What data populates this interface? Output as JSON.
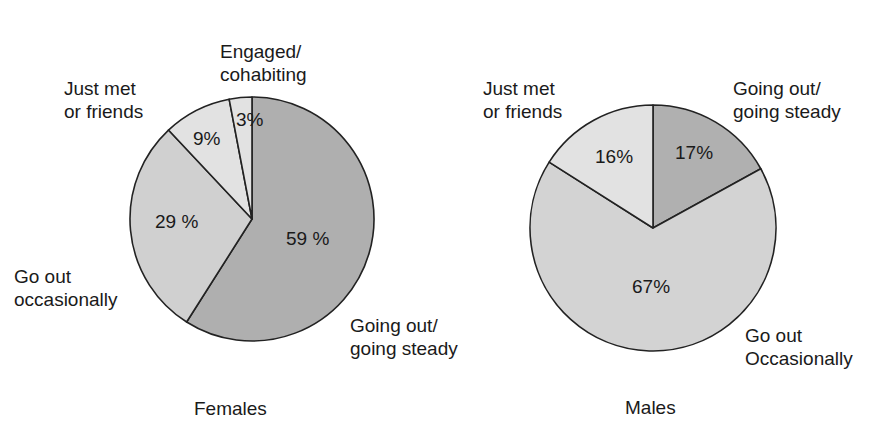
{
  "chart_data": [
    {
      "type": "pie",
      "title": "Females",
      "start": "top, clockwise",
      "categories": [
        "Going out/ going steady",
        "Go out occasionally",
        "Just met or friends",
        "Engaged/ cohabiting"
      ],
      "values": [
        59,
        29,
        9,
        3
      ],
      "value_labels": [
        "59 %",
        "29 %",
        "9%",
        "3%"
      ],
      "colors": [
        "#afafaf",
        "#d0d0d0",
        "#e2e2e2",
        "#e2e2e2"
      ],
      "legend": "none (labels placed beside slices)"
    },
    {
      "type": "pie",
      "title": "Males",
      "start": "top, clockwise",
      "categories": [
        "Going out/ going steady",
        "Go out Occasionally",
        "Just met or friends"
      ],
      "values": [
        17,
        67,
        16
      ],
      "value_labels": [
        "17%",
        "67%",
        "16%"
      ],
      "colors": [
        "#b0b0b0",
        "#d3d3d3",
        "#e2e2e2"
      ],
      "legend": "none (labels placed beside slices)"
    }
  ],
  "females": {
    "title": "Females",
    "labels": {
      "engaged_l1": "Engaged/",
      "engaged_l2": "cohabiting",
      "justmet_l1": "Just met",
      "justmet_l2": "or friends",
      "goout_l1": "Go out",
      "goout_l2": "occasionally",
      "steady_l1": "Going out/",
      "steady_l2": "going steady"
    },
    "pcts": {
      "steady": "59 %",
      "goout": "29 %",
      "justmet": "9%",
      "engaged": "3%"
    }
  },
  "males": {
    "title": "Males",
    "labels": {
      "justmet_l1": "Just met",
      "justmet_l2": "or friends",
      "steady_l1": "Going out/",
      "steady_l2": "going steady",
      "goout_l1": "Go out",
      "goout_l2": "Occasionally"
    },
    "pcts": {
      "steady": "17%",
      "goout": "67%",
      "justmet": "16%"
    }
  }
}
